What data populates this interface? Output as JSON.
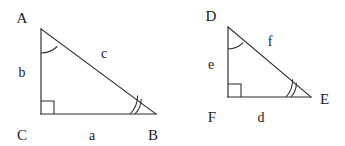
{
  "figure": {
    "background_color": "#ffffff",
    "line_color": "#2a2a2a",
    "text_color": "#1a1a1a"
  },
  "triangles": [
    {
      "id": "abc",
      "name": "triangle-abc",
      "vertices": [
        {
          "name": "A",
          "label": "A",
          "x": 41,
          "y": 29,
          "label_x": 22,
          "label_y": 23,
          "angle_mark": "single-arc"
        },
        {
          "name": "B",
          "label": "B",
          "x": 156,
          "y": 114,
          "label_x": 153,
          "label_y": 140,
          "angle_mark": "double-arc"
        },
        {
          "name": "C",
          "label": "C",
          "x": 41,
          "y": 114,
          "label_x": 22,
          "label_y": 140,
          "angle_mark": "right-angle"
        }
      ],
      "sides": [
        {
          "name": "a",
          "label": "a",
          "between": "C-B",
          "label_x": 92,
          "label_y": 140
        },
        {
          "name": "b",
          "label": "b",
          "between": "A-C",
          "label_x": 22,
          "label_y": 77
        },
        {
          "name": "c",
          "label": "c",
          "between": "A-B",
          "label_x": 104,
          "label_y": 58
        }
      ]
    },
    {
      "id": "def",
      "name": "triangle-def",
      "vertices": [
        {
          "name": "D",
          "label": "D",
          "x": 228,
          "y": 27,
          "label_x": 211,
          "label_y": 21,
          "angle_mark": "single-arc"
        },
        {
          "name": "E",
          "label": "E",
          "x": 311,
          "y": 97,
          "label_x": 320,
          "label_y": 104,
          "angle_mark": "double-arc"
        },
        {
          "name": "F",
          "label": "F",
          "x": 228,
          "y": 97,
          "label_x": 212,
          "label_y": 122,
          "angle_mark": "right-angle"
        }
      ],
      "sides": [
        {
          "name": "d",
          "label": "d",
          "between": "F-E",
          "label_x": 261,
          "label_y": 122
        },
        {
          "name": "e",
          "label": "e",
          "between": "D-F",
          "label_x": 211,
          "label_y": 69
        },
        {
          "name": "f",
          "label": "f",
          "between": "D-E",
          "label_x": 270,
          "label_y": 46
        }
      ]
    }
  ]
}
